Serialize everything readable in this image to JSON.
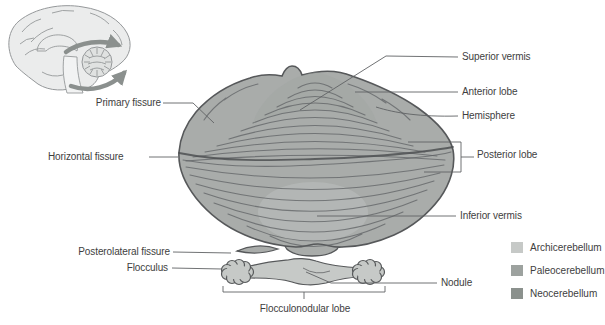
{
  "figure": {
    "labels": {
      "superior_vermis": "Superior vermis",
      "anterior_lobe": "Anterior lobe",
      "hemisphere": "Hemisphere",
      "posterior_lobe": "Posterior lobe",
      "inferior_vermis": "Inferior vermis",
      "primary_fissure": "Primary fissure",
      "horizontal_fissure": "Horizontal fissure",
      "posterolateral_fissure": "Posterolateral fissure",
      "flocculus": "Flocculus",
      "nodule": "Nodule",
      "flocculonodular_lobe": "Flocculonodular lobe"
    },
    "legend": {
      "items": [
        {
          "label": "Archicerebellum",
          "color": "#c6c9c7"
        },
        {
          "label": "Paleocerebellum",
          "color": "#9da29f"
        },
        {
          "label": "Neocerebellum",
          "color": "#8b918d"
        }
      ]
    }
  },
  "colors": {
    "text": "#3e3e3e",
    "leader": "#606264",
    "outline": "#56585a",
    "folia": "#5f6264",
    "mass": "#a9acaa",
    "mass-light": "#bcbfbd",
    "archi": "#c6c9c7",
    "paleo": "#9da29f",
    "neo": "#8b918d",
    "arrow": "#8b908e",
    "inset": "#ebecec",
    "inset-line": "#95989a"
  }
}
